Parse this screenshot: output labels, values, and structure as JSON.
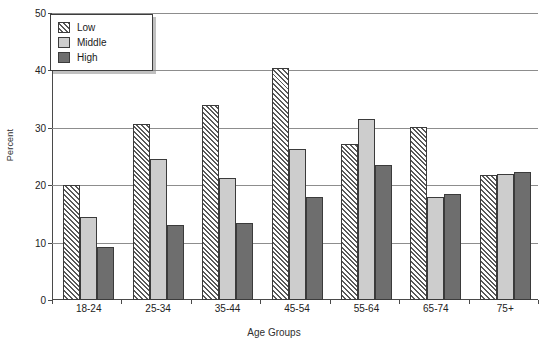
{
  "chart_data": {
    "type": "bar",
    "title": "",
    "xlabel": "Age Groups",
    "ylabel": "Percent",
    "categories": [
      "18-24",
      "25-34",
      "35-44",
      "45-54",
      "55-64",
      "65-74",
      "75+"
    ],
    "series": [
      {
        "name": "Low",
        "values": [
          20.0,
          30.6,
          34.0,
          40.4,
          27.2,
          30.1,
          21.8
        ]
      },
      {
        "name": "Middle",
        "values": [
          14.4,
          24.5,
          21.2,
          26.3,
          31.6,
          18.0,
          21.9
        ]
      },
      {
        "name": "High",
        "values": [
          9.3,
          13.1,
          13.4,
          17.9,
          23.5,
          18.5,
          22.3
        ]
      }
    ],
    "ylim": [
      0,
      50
    ],
    "yticks": [
      0,
      10,
      20,
      30,
      40,
      50
    ],
    "ytick_labels": [
      "0",
      "10",
      "20",
      "30",
      "40",
      "50"
    ],
    "grid": true,
    "legend_position": "top-left",
    "legend": [
      "Low",
      "Middle",
      "High"
    ],
    "colors": {
      "low": "#ffffff",
      "low_hatch": "#595959",
      "middle": "#cdcdcd",
      "high": "#6e6e6e",
      "axis": "#4a4a4a",
      "gridline": "#8d8d8d",
      "text": "#1a1a1a"
    }
  }
}
